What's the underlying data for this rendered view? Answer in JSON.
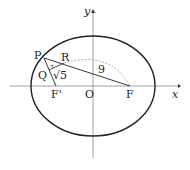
{
  "diagram": {
    "axes": {
      "x_label": "x",
      "y_label": "y",
      "origin_label": "O"
    },
    "points": {
      "P": "P",
      "Q": "Q",
      "R": "R",
      "F": "F",
      "F_prime": "F'"
    },
    "measurements": {
      "PF_arc": "9",
      "QR_sqrt": "√5"
    },
    "colors": {
      "stroke": "#222222",
      "dashed": "#999999"
    }
  }
}
